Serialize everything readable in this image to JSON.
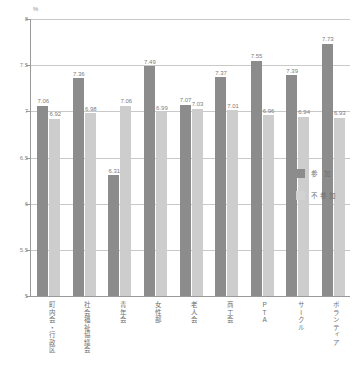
{
  "chart_data": {
    "type": "bar",
    "title": "",
    "xlabel": "",
    "ylabel": "%",
    "unit_label": "%",
    "ylim": [
      5,
      8
    ],
    "yticks": [
      "8",
      "7.5",
      "7",
      "6.5",
      "6",
      "5.5",
      "5"
    ],
    "ytick_values": [
      8,
      7.5,
      7,
      6.5,
      6,
      5.5,
      5
    ],
    "grid": true,
    "legend_position": "right",
    "categories": [
      "町内会・行政区",
      "社会福祉協議会",
      "青年会",
      "女性部",
      "老人会",
      "商工会",
      "PTA",
      "サークル",
      "ボランティア"
    ],
    "series": [
      {
        "name": "参 加",
        "color": "#8c8c8c",
        "values": [
          7.06,
          7.36,
          6.31,
          7.49,
          7.07,
          7.37,
          7.55,
          7.39,
          7.73
        ],
        "labels": [
          "7.06",
          "7.36",
          "6.31",
          "7.49",
          "7.07",
          "7.37",
          "7.55",
          "7.39",
          "7.73"
        ]
      },
      {
        "name": "不参加",
        "color": "#cdcdcd",
        "values": [
          6.92,
          6.98,
          7.06,
          6.99,
          7.03,
          7.01,
          6.96,
          6.94,
          6.93
        ],
        "labels": [
          "6.92",
          "6.98",
          "7.06",
          "6.99",
          "7.03",
          "7.01",
          "6.96",
          "6.94",
          "6.93"
        ]
      }
    ]
  },
  "legend": {
    "items": [
      {
        "label": "参 加"
      },
      {
        "label": "不参加"
      }
    ]
  },
  "colors": {
    "series_dark": "#8c8c8c",
    "series_light": "#cdcdcd",
    "axis": "#9a9a9a",
    "grid": "#c9c9c9",
    "text": "#6f6f6f"
  }
}
